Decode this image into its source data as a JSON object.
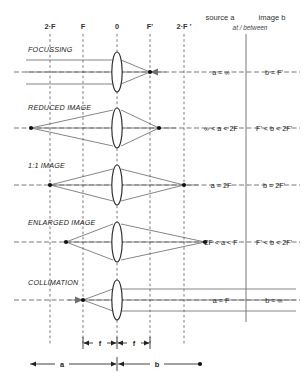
{
  "diagram": {
    "axis_labels": [
      {
        "text": "2·F",
        "x": 50
      },
      {
        "text": "F",
        "x": 83
      },
      {
        "text": "0",
        "x": 117
      },
      {
        "text": "F'",
        "x": 150
      },
      {
        "text": "2·F '",
        "x": 184
      }
    ],
    "header": {
      "source_col": "source a",
      "image_col": "image b",
      "subnote": "at / between"
    },
    "rows": [
      {
        "label": "FOCUSSING",
        "source": "a = ∞",
        "image": "b = F'"
      },
      {
        "label": "REDUCED IMAGE",
        "source": "∞ < a < 2F",
        "image": "F' < b < 2F'"
      },
      {
        "label": "1:1 IMAGE",
        "source": "a = 2F",
        "image": "b = 2F'"
      },
      {
        "label": "ENLARGED IMAGE",
        "source": "2F < a < F",
        "image": "F' < b < 2F'"
      },
      {
        "label": "COLLIMATION",
        "source": "a = F",
        "image": "b = ∞"
      }
    ],
    "dimensions": {
      "focal_left": "f",
      "focal_right": "f",
      "span_a": "a",
      "span_b": "b"
    },
    "colors": {
      "ray": "#6f6f6f",
      "grid": "#555555",
      "lens_outline": "#2a2a2a",
      "text": "#222222",
      "background": "#ffffff"
    }
  }
}
